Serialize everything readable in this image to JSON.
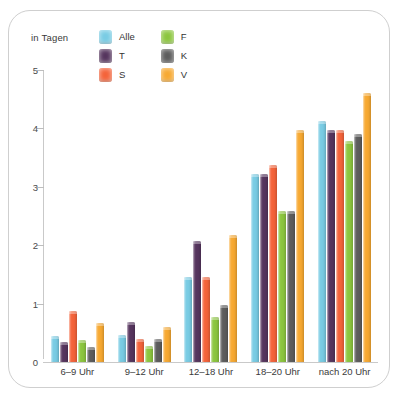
{
  "unit_label": "in Tagen",
  "legend": {
    "items": [
      {
        "key": "Alle",
        "label": "Alle",
        "color": "#79cce4"
      },
      {
        "key": "F",
        "label": "F",
        "color": "#8cc63f"
      },
      {
        "key": "T",
        "label": "T",
        "color": "#56355e"
      },
      {
        "key": "K",
        "label": "K",
        "color": "#5d5d5d"
      },
      {
        "key": "S",
        "label": "S",
        "color": "#f4633a"
      },
      {
        "key": "V",
        "label": "V",
        "color": "#f7a932"
      }
    ]
  },
  "axis": {
    "y_ticks": [
      "0",
      "1",
      "2",
      "3",
      "4",
      "5"
    ]
  },
  "chart_data": {
    "type": "bar",
    "title": "",
    "subtitle": "",
    "xlabel": "",
    "ylabel": "in Tagen",
    "ylim": [
      0,
      5
    ],
    "yticks": [
      0,
      1,
      2,
      3,
      4,
      5
    ],
    "grid": false,
    "legend_position": "top",
    "categories": [
      "6–9 Uhr",
      "9–12 Uhr",
      "12–18 Uhr",
      "18–20 Uhr",
      "nach 20 Uhr"
    ],
    "series": [
      {
        "name": "Alle",
        "color": "#79cce4",
        "values": [
          0.45,
          0.47,
          1.45,
          3.22,
          4.13
        ]
      },
      {
        "name": "T",
        "color": "#56355e",
        "values": [
          0.35,
          0.68,
          2.08,
          3.22,
          3.98
        ]
      },
      {
        "name": "S",
        "color": "#f4633a",
        "values": [
          0.88,
          0.4,
          1.45,
          3.38,
          3.98
        ]
      },
      {
        "name": "F",
        "color": "#8cc63f",
        "values": [
          0.38,
          0.27,
          0.77,
          2.58,
          3.78
        ]
      },
      {
        "name": "K",
        "color": "#5d5d5d",
        "values": [
          0.25,
          0.4,
          0.98,
          2.58,
          3.9
        ]
      },
      {
        "name": "V",
        "color": "#f7a932",
        "values": [
          0.67,
          0.6,
          2.18,
          3.98,
          4.6
        ]
      }
    ]
  }
}
